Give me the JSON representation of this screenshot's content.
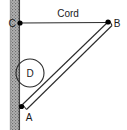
{
  "diagram": {
    "type": "statics-free-body-diagram",
    "canvas": {
      "width": 127,
      "height": 130,
      "background": "#ffffff"
    },
    "colors": {
      "line": "#2b2b2b",
      "wall_fill": "#9a9a9a",
      "wall_edge": "#4a4a4a",
      "text": "#1a1a1a",
      "node": "#000000"
    },
    "wall": {
      "name": "wall",
      "x": 10,
      "y": 0,
      "width": 10,
      "height": 130,
      "hatch": "stipple"
    },
    "labels": {
      "cord": "Cord",
      "point_a": "A",
      "point_b": "B",
      "point_c": "C",
      "pulley_d": "D"
    },
    "nodes": [
      {
        "id": "C",
        "label": "C",
        "x": 20,
        "y": 23,
        "label_x": 12,
        "label_y": 27
      },
      {
        "id": "B",
        "label": "B",
        "x": 108,
        "y": 22,
        "label_x": 113,
        "label_y": 27
      },
      {
        "id": "A",
        "label": "A",
        "x": 21,
        "y": 107,
        "label_x": 25,
        "label_y": 120
      }
    ],
    "members": [
      {
        "id": "cord",
        "label": "Cord",
        "from": "C",
        "to": "B",
        "style": "single-line"
      },
      {
        "id": "rod",
        "label": "",
        "from": "A",
        "to": "B",
        "style": "double-line"
      }
    ],
    "circle": {
      "id": "D",
      "label": "D",
      "cx": 30,
      "cy": 73,
      "r": 14,
      "label_x": 30,
      "label_y": 77
    },
    "cord_label_pos": {
      "x": 68,
      "y": 17
    }
  }
}
